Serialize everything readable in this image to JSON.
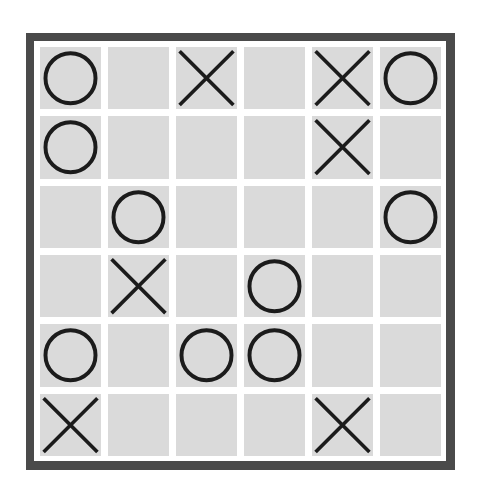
{
  "board": {
    "name": "tic-tac-toe-grid",
    "rows": 6,
    "columns": 6,
    "symbols": {
      "circle": "O",
      "cross": "X",
      "empty": ""
    },
    "colors": {
      "frame": "#4a4a4a",
      "matte": "#ffffff",
      "cell": "#dadada",
      "mark": "#1b1b1b",
      "background": "#ffffff"
    },
    "cells": [
      [
        {
          "mark": "circle",
          "label": "O"
        },
        {
          "mark": "empty",
          "label": ""
        },
        {
          "mark": "cross",
          "label": "X"
        },
        {
          "mark": "empty",
          "label": ""
        },
        {
          "mark": "cross",
          "label": "X"
        },
        {
          "mark": "circle",
          "label": "O"
        }
      ],
      [
        {
          "mark": "circle",
          "label": "O"
        },
        {
          "mark": "empty",
          "label": ""
        },
        {
          "mark": "empty",
          "label": ""
        },
        {
          "mark": "empty",
          "label": ""
        },
        {
          "mark": "cross",
          "label": "X"
        },
        {
          "mark": "empty",
          "label": ""
        }
      ],
      [
        {
          "mark": "empty",
          "label": ""
        },
        {
          "mark": "circle",
          "label": "O"
        },
        {
          "mark": "empty",
          "label": ""
        },
        {
          "mark": "empty",
          "label": ""
        },
        {
          "mark": "empty",
          "label": ""
        },
        {
          "mark": "circle",
          "label": "O"
        }
      ],
      [
        {
          "mark": "empty",
          "label": ""
        },
        {
          "mark": "cross",
          "label": "X"
        },
        {
          "mark": "empty",
          "label": ""
        },
        {
          "mark": "circle",
          "label": "O"
        },
        {
          "mark": "empty",
          "label": ""
        },
        {
          "mark": "empty",
          "label": ""
        }
      ],
      [
        {
          "mark": "circle",
          "label": "O"
        },
        {
          "mark": "empty",
          "label": ""
        },
        {
          "mark": "circle",
          "label": "O"
        },
        {
          "mark": "circle",
          "label": "O"
        },
        {
          "mark": "empty",
          "label": ""
        },
        {
          "mark": "empty",
          "label": ""
        }
      ],
      [
        {
          "mark": "cross",
          "label": "X"
        },
        {
          "mark": "empty",
          "label": ""
        },
        {
          "mark": "empty",
          "label": ""
        },
        {
          "mark": "empty",
          "label": ""
        },
        {
          "mark": "cross",
          "label": "X"
        },
        {
          "mark": "empty",
          "label": ""
        }
      ]
    ]
  }
}
